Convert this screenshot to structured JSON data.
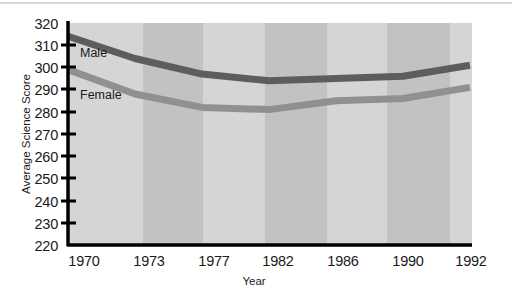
{
  "chart_data": {
    "type": "line",
    "title": "",
    "xlabel": "Year",
    "ylabel": "Average Science Score",
    "x": [
      1970,
      1973,
      1977,
      1982,
      1986,
      1990,
      1992
    ],
    "categories": [
      "1970",
      "1973",
      "1977",
      "1982",
      "1986",
      "1990",
      "1992"
    ],
    "xtick_labels": [
      "1970",
      "1973",
      "1977",
      "1982",
      "1986",
      "1990",
      "1992"
    ],
    "ytick_labels": [
      "220",
      "230",
      "240",
      "250",
      "260",
      "270",
      "280",
      "290",
      "300",
      "310",
      "320"
    ],
    "ylim": [
      220,
      320
    ],
    "ytick_step": 10,
    "grid": false,
    "legend_position": "inline-labels",
    "series": [
      {
        "name": "Male",
        "label": "Male",
        "color": "#5d5d5d",
        "values": [
          314,
          304,
          297,
          294,
          295,
          296,
          301
        ]
      },
      {
        "name": "Female",
        "label": "Female",
        "color": "#909090",
        "values": [
          299,
          288,
          282,
          281,
          285,
          286,
          291
        ]
      }
    ],
    "band_colors": [
      "#d5d5d5",
      "#c2c2c2"
    ],
    "plot_background": "#d5d5d5",
    "axis_color": "#000000"
  },
  "axis": {
    "y_label": "Average Science Score",
    "x_label": "Year"
  }
}
